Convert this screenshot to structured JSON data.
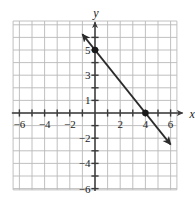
{
  "figure": {
    "kind": "coordinate-plane-line-graph",
    "background_color": "#ffffff",
    "grid_color": "#b9b9b9",
    "axis_color": "#3b3b3b",
    "line_color": "#2b2b2b",
    "point_color": "#1a1a1a",
    "label_color": "#1a1a1a"
  },
  "axes": {
    "x_label": "x",
    "y_label": "y",
    "x_tick_labels": [
      "−6",
      "−4",
      "−2",
      "2",
      "4",
      "6"
    ],
    "x_tick_values": [
      -6,
      -4,
      -2,
      2,
      4,
      6
    ],
    "y_tick_labels": [
      "5",
      "3",
      "1",
      "−2",
      "−4",
      "−6"
    ],
    "y_tick_values": [
      5,
      3,
      1,
      -2,
      -4,
      -6
    ],
    "x_range": [
      -7,
      7
    ],
    "y_range": [
      -7,
      7
    ],
    "grid": "on",
    "grid_step": 1
  },
  "chart_data": {
    "type": "line",
    "title": "",
    "xlabel": "x",
    "ylabel": "y",
    "xlim": [
      -7,
      7
    ],
    "ylim": [
      -7,
      7
    ],
    "grid": true,
    "series": [
      {
        "name": "line",
        "equation": "y = -5/4 x + 5",
        "slope": -1.25,
        "y_intercept": 5,
        "x_intercept": 4,
        "arrow_start": {
          "x": -1.0,
          "y": 6.25
        },
        "arrow_end": {
          "x": 6.0,
          "y": -2.5
        },
        "arrows": "both",
        "points": [
          {
            "x": 0,
            "y": 5,
            "marker": "filled-circle"
          },
          {
            "x": 4,
            "y": 0,
            "marker": "filled-circle"
          }
        ]
      }
    ],
    "x_tick_labels": [
      "−6",
      "−4",
      "−2",
      "2",
      "4",
      "6"
    ],
    "y_tick_labels": [
      "5",
      "3",
      "1",
      "−2",
      "−4",
      "−6"
    ],
    "legend": null
  }
}
